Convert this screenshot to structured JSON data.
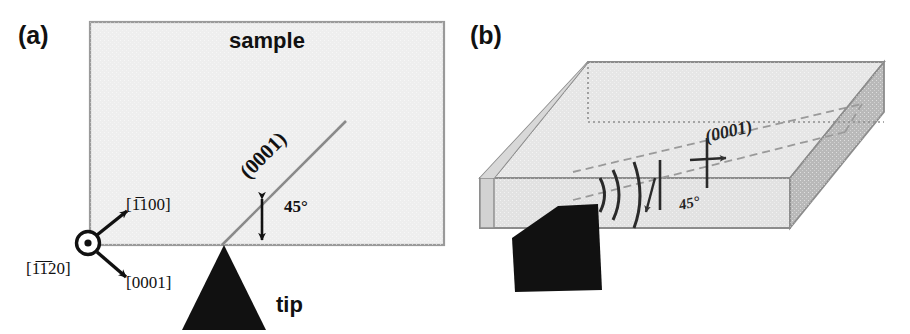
{
  "figure": {
    "background": "#ffffff",
    "ink": "#111111",
    "sample_fill": "#eeeeee",
    "sample_stroke": "#999999",
    "plane_line_color": "#8a8a8a",
    "block_top_fill": "#e4e4e4",
    "block_front_fill": "#e0e0e0",
    "block_cut_fill": "#d7d7d7",
    "block_right_fill": "#b8b8b8",
    "block_stroke": "#8c8c8c",
    "dashed_color": "#9a9a9a",
    "tip_color": "#111111"
  },
  "panel_a": {
    "label": "(a)",
    "sample_label": "sample",
    "plane_label": "(0001)",
    "angle_label": "45°",
    "tip_label": "tip",
    "directions": [
      {
        "id": "out-of-page",
        "label": "[1̅1̅20]",
        "chars": [
          "[",
          "1",
          "1",
          "2",
          "0",
          "]"
        ],
        "overbar": [
          false,
          true,
          true,
          false,
          false,
          false
        ]
      },
      {
        "id": "up-right",
        "label": "[1̅100]",
        "chars": [
          "[",
          "1",
          "1",
          "0",
          "0",
          "]"
        ],
        "overbar": [
          false,
          true,
          false,
          false,
          false,
          false
        ]
      },
      {
        "id": "down-right",
        "label": "[0001]",
        "chars": [
          "[",
          "0",
          "0",
          "0",
          "1",
          "]"
        ],
        "overbar": [
          false,
          false,
          false,
          false,
          false,
          false
        ]
      }
    ]
  },
  "panel_b": {
    "label": "(b)",
    "plane_label": "(0001)",
    "angle_label": "45°"
  }
}
